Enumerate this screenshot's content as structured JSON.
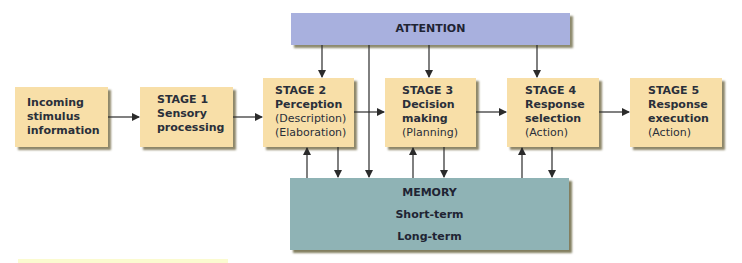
{
  "diagram": {
    "attention": {
      "label": "ATTENTION",
      "color": "#a8b0de"
    },
    "memory": {
      "title": "MEMORY",
      "items": [
        "Short-term",
        "Long-term"
      ],
      "color": "#8fb3b5"
    },
    "stage_color": "#f8dfa8",
    "boxes": [
      {
        "id": "incoming",
        "bold": [
          "Incoming",
          "stimulus",
          "information"
        ],
        "normal": []
      },
      {
        "id": "stage1",
        "bold": [
          "STAGE 1",
          "Sensory",
          "processing"
        ],
        "normal": []
      },
      {
        "id": "stage2",
        "bold": [
          "STAGE 2",
          "Perception"
        ],
        "normal": [
          "(Description)",
          "(Elaboration)"
        ]
      },
      {
        "id": "stage3",
        "bold": [
          "STAGE 3",
          "Decision",
          "making"
        ],
        "normal": [
          "(Planning)"
        ]
      },
      {
        "id": "stage4",
        "bold": [
          "STAGE 4",
          "Response",
          "selection"
        ],
        "normal": [
          "(Action)"
        ]
      },
      {
        "id": "stage5",
        "bold": [
          "STAGE 5",
          "Response",
          "execution"
        ],
        "normal": [
          "(Action)"
        ]
      }
    ],
    "flow": [
      "incoming",
      "stage1",
      "stage2",
      "stage3",
      "stage4",
      "stage5"
    ]
  }
}
